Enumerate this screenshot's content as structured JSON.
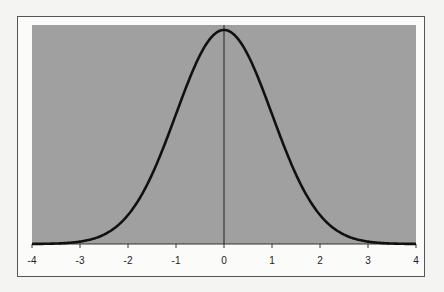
{
  "chart_data": {
    "type": "line",
    "title": "",
    "xlabel": "",
    "ylabel": "",
    "xlim": [
      -4,
      4
    ],
    "ylim": [
      0,
      0.4
    ],
    "x_ticks": [
      "-4",
      "-3",
      "-2",
      "-1",
      "0",
      "1",
      "2",
      "3",
      "4"
    ],
    "series": [
      {
        "name": "Standard normal density",
        "function": "exp(-x^2/2)/sqrt(2*pi)",
        "color": "#111111"
      }
    ],
    "vertical_line_at_x": 0,
    "plot_background": "#a0a0a0",
    "grid": false,
    "legend": "none"
  }
}
